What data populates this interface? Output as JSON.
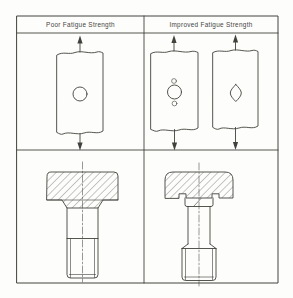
{
  "columns": [
    {
      "label": "Poor Fatigue Strength"
    },
    {
      "label": "Improved Fatigue Strength"
    }
  ],
  "colors": {
    "ink": "#42423c",
    "paper": "#fdfdfb"
  }
}
